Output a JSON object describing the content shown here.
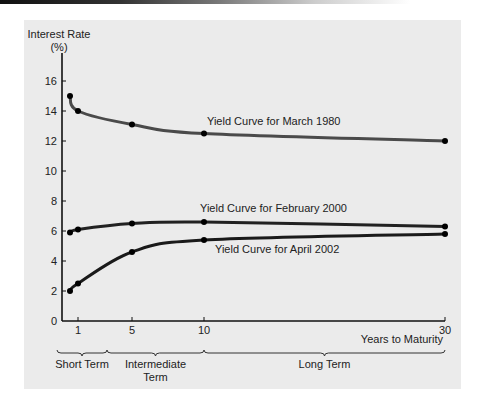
{
  "chart_data": {
    "type": "line",
    "title": "",
    "xlabel": "Years to Maturity",
    "ylabel": "Interest Rate (%)",
    "ylabel_lines": [
      "Interest Rate",
      "(%)"
    ],
    "ylim": [
      0,
      16
    ],
    "yticks": [
      0,
      2,
      4,
      6,
      8,
      10,
      12,
      14,
      16
    ],
    "xticks": [
      1,
      5,
      10,
      30
    ],
    "grid": false,
    "legend": "inline labels",
    "series": [
      {
        "name": "Yield Curve for March 1980",
        "color": "#4a4a4a",
        "x": [
          0.25,
          1,
          5,
          10,
          30
        ],
        "values": [
          15.0,
          14.0,
          13.1,
          12.5,
          12.0
        ],
        "label_pos": [
          207,
          125
        ]
      },
      {
        "name": "Yield Curve for February 2000",
        "color": "#222222",
        "x": [
          0.25,
          1,
          5,
          10,
          30
        ],
        "values": [
          5.9,
          6.1,
          6.5,
          6.6,
          6.3
        ],
        "label_pos": [
          200,
          212
        ]
      },
      {
        "name": "Yield Curve for April 2002",
        "color": "#1a1a1a",
        "x": [
          0.25,
          1,
          5,
          10,
          30
        ],
        "values": [
          2.0,
          2.5,
          4.6,
          5.4,
          5.8
        ],
        "label_pos": [
          215,
          253
        ]
      }
    ],
    "term_groups": [
      {
        "label_lines": [
          "Short Term"
        ],
        "from": 0,
        "to": 3
      },
      {
        "label_lines": [
          "Intermediate",
          "Term"
        ],
        "from": 3,
        "to": 10
      },
      {
        "label_lines": [
          "Long Term"
        ],
        "from": 10,
        "to": 30
      }
    ]
  },
  "layout": {
    "x_px": {
      "0": 57,
      "0.25": 70,
      "1": 78,
      "3": 107,
      "5": 132,
      "10": 204,
      "30": 445
    },
    "y_zero_px": 321,
    "y_px_per_unit": 15,
    "axis_left_px": 62,
    "axis_top_px": 53,
    "axis_right_px": 445
  }
}
